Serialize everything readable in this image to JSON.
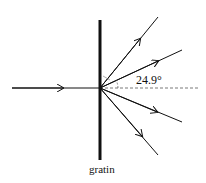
{
  "diagram": {
    "angle_label": "24.9°",
    "grating_label": "gratin",
    "colors": {
      "line": "#111111",
      "dashed": "#555555"
    },
    "rays": [
      {
        "name": "incident-ray",
        "kind": "incident"
      },
      {
        "name": "diffracted-ray-upper-outer",
        "kind": "diffracted"
      },
      {
        "name": "diffracted-ray-upper-inner",
        "kind": "diffracted"
      },
      {
        "name": "diffracted-ray-lower-inner",
        "kind": "diffracted"
      },
      {
        "name": "diffracted-ray-lower-outer",
        "kind": "diffracted"
      }
    ]
  }
}
